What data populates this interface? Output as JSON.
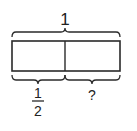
{
  "diagram": {
    "type": "tape-diagram",
    "total_label": "1",
    "parts": [
      {
        "label_numerator": "1",
        "label_denominator": "2"
      },
      {
        "label": "?"
      }
    ],
    "stroke_color": "#2a2a2a",
    "background": "#ffffff"
  }
}
